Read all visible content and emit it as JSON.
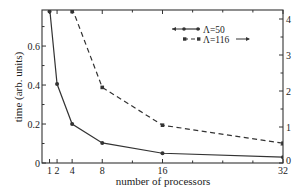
{
  "chart_data": {
    "type": "line",
    "title": "",
    "xlabel": "number of processors",
    "ylabel": "time (arb. units)",
    "ylabel_right": "",
    "x_ticks": [
      1,
      2,
      4,
      8,
      16,
      32
    ],
    "x_tick_labels": [
      "1",
      "2",
      "4",
      "8",
      "16",
      "32"
    ],
    "x_minor_ticks": [
      12,
      20,
      24,
      28
    ],
    "xlim": [
      0,
      32
    ],
    "ylim_left": [
      0,
      0.785
    ],
    "y_ticks_left": [
      0,
      0.2,
      0.4,
      0.6
    ],
    "y_tick_labels_left": [
      "0",
      "0.2",
      "0.4",
      "0.6"
    ],
    "ylim_right": [
      0,
      4.25
    ],
    "y_ticks_right": [
      0,
      1,
      2,
      3,
      4
    ],
    "y_tick_labels_right": [
      "0",
      "1",
      "2",
      "3",
      "4"
    ],
    "grid": false,
    "legend_position": "upper right",
    "series": [
      {
        "name": "Λ=50",
        "axis": "left",
        "style": "solid",
        "marker": "circle",
        "x": [
          1,
          2,
          4,
          8,
          16,
          32
        ],
        "values": [
          0.8,
          0.405,
          0.2,
          0.103,
          0.05,
          0.03
        ]
      },
      {
        "name": "Λ=116",
        "axis": "right",
        "style": "dashed",
        "marker": "square",
        "x": [
          4,
          8,
          16,
          32
        ],
        "values": [
          4.3,
          2.1,
          1.05,
          0.55
        ]
      }
    ]
  },
  "legend": {
    "items": [
      {
        "label": "Λ=50",
        "arrow": "←"
      },
      {
        "label": "Λ=116",
        "arrow": "→"
      }
    ]
  },
  "colors": {
    "line": "#333333",
    "axis": "#333333"
  }
}
